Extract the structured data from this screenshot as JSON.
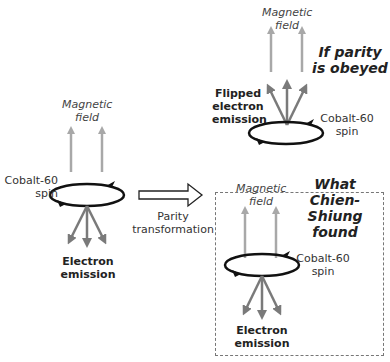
{
  "left_panel": {
    "field_label": [
      "Magnetic",
      "field"
    ],
    "spin_label": [
      "Cobalt-60",
      "spin"
    ],
    "emission_label": [
      "Electron",
      "emission"
    ]
  },
  "transform": {
    "label": [
      "Parity",
      "transformation"
    ]
  },
  "top_right_panel": {
    "title": [
      "If parity",
      "is obeyed"
    ],
    "field_label": [
      "Magnetic",
      "field"
    ],
    "emission_label": [
      "Flipped",
      "electron",
      "emission"
    ],
    "spin_label": [
      "Cobalt-60",
      "spin"
    ]
  },
  "bottom_right_panel": {
    "title": [
      "What",
      "Chien-Shiung",
      "found"
    ],
    "field_label": [
      "Magnetic",
      "field"
    ],
    "spin_label": [
      "Cobalt-60",
      "spin"
    ],
    "emission_label": [
      "Electron",
      "emission"
    ]
  },
  "colors": {
    "field_arrow": "#a8a8a8",
    "emission_arrow": "#7a7a7a",
    "spin_ring": "#111111",
    "dashed_border": "#777777"
  }
}
